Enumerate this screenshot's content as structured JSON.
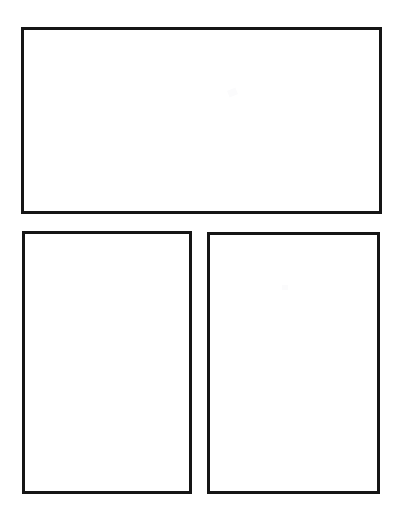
{
  "page": {
    "background_color": "#ffffff",
    "width": 404,
    "height": 520,
    "media": "scanned paper"
  },
  "style": {
    "border_color": "#151515",
    "border_width_px": 3,
    "fill_color": "#ffffff"
  },
  "panels": [
    {
      "id": "panel-top",
      "name": "top-wide-panel",
      "orientation": "landscape",
      "row": 1,
      "column": 1,
      "content": "",
      "x": 21,
      "y": 27,
      "width": 361,
      "height": 187
    },
    {
      "id": "panel-bottom-left",
      "name": "bottom-left-panel",
      "orientation": "portrait",
      "row": 2,
      "column": 1,
      "content": "",
      "x": 22,
      "y": 231,
      "width": 170,
      "height": 263
    },
    {
      "id": "panel-bottom-right",
      "name": "bottom-right-panel",
      "orientation": "portrait",
      "row": 2,
      "column": 2,
      "content": "",
      "x": 207,
      "y": 232,
      "width": 173,
      "height": 262
    }
  ],
  "artifacts": [
    {
      "id": "artifact-top",
      "name": "faint-scan-mark-top",
      "x": 228,
      "y": 89
    },
    {
      "id": "artifact-bottom-right",
      "name": "faint-scan-mark-bottom-right",
      "x": 282,
      "y": 285
    }
  ]
}
